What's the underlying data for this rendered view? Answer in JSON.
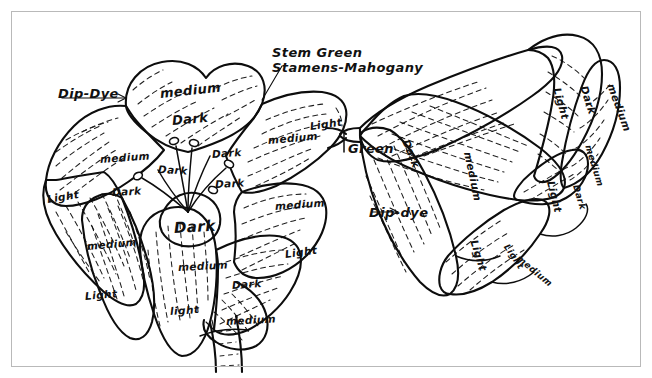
{
  "sheet": {
    "title": "Flower shading / dye plan sketch",
    "background_color": "#ffffff",
    "ink_color": "#0d0d0d",
    "frame_color": "#b9b9b9"
  },
  "callouts": [
    {
      "id": "dip-dye-left",
      "text": "Dip-Dye",
      "x": 58,
      "y": 86,
      "rot": 0
    },
    {
      "id": "stem-green",
      "text": "Stem Green",
      "x": 272,
      "y": 45,
      "rot": 0
    },
    {
      "id": "stamens",
      "text": "Stamens-Mahogany",
      "x": 272,
      "y": 60,
      "rot": 0
    },
    {
      "id": "green-stem",
      "text": "Green",
      "x": 348,
      "y": 141,
      "rot": 0
    },
    {
      "id": "dip-dye-right",
      "text": "Dip-dye",
      "x": 369,
      "y": 205,
      "rot": 0
    }
  ],
  "left_flower": {
    "name": "left-flower",
    "labels": [
      {
        "id": "l1",
        "text": "medium",
        "x": 160,
        "y": 86,
        "rot": -6,
        "size": "sz-l"
      },
      {
        "id": "l2",
        "text": "Dark",
        "x": 172,
        "y": 113,
        "rot": -5,
        "size": "sz-l"
      },
      {
        "id": "l3",
        "text": "medium",
        "x": 100,
        "y": 153,
        "rot": -4,
        "size": "sz-m"
      },
      {
        "id": "l4",
        "text": "Dark",
        "x": 158,
        "y": 163,
        "rot": 3,
        "size": "sz-m"
      },
      {
        "id": "l5",
        "text": "medium",
        "x": 268,
        "y": 134,
        "rot": -5,
        "size": "sz-m"
      },
      {
        "id": "l6",
        "text": "Light",
        "x": 310,
        "y": 120,
        "rot": -8,
        "size": "sz-m"
      },
      {
        "id": "l7",
        "text": "Dark",
        "x": 212,
        "y": 148,
        "rot": -4,
        "size": "sz-m"
      },
      {
        "id": "l8",
        "text": "Dark",
        "x": 215,
        "y": 178,
        "rot": -3,
        "size": "sz-m"
      },
      {
        "id": "l9",
        "text": "Light",
        "x": 47,
        "y": 193,
        "rot": -9,
        "size": "sz-m"
      },
      {
        "id": "l10",
        "text": "Dark",
        "x": 112,
        "y": 186,
        "rot": -3,
        "size": "sz-m"
      },
      {
        "id": "l11",
        "text": "Dark",
        "x": 174,
        "y": 219,
        "rot": -3,
        "size": "sz-xl"
      },
      {
        "id": "l12",
        "text": "medium",
        "x": 275,
        "y": 200,
        "rot": -4,
        "size": "sz-m"
      },
      {
        "id": "l13",
        "text": "medium",
        "x": 87,
        "y": 240,
        "rot": -5,
        "size": "sz-m"
      },
      {
        "id": "l14",
        "text": "medium",
        "x": 178,
        "y": 261,
        "rot": -3,
        "size": "sz-m"
      },
      {
        "id": "l15",
        "text": "Light",
        "x": 285,
        "y": 248,
        "rot": -8,
        "size": "sz-m"
      },
      {
        "id": "l16",
        "text": "Dark",
        "x": 232,
        "y": 279,
        "rot": -4,
        "size": "sz-m"
      },
      {
        "id": "l17",
        "text": "Light",
        "x": 85,
        "y": 290,
        "rot": -5,
        "size": "sz-m"
      },
      {
        "id": "l18",
        "text": "light",
        "x": 170,
        "y": 305,
        "rot": -4,
        "size": "sz-m"
      },
      {
        "id": "l19",
        "text": "medium",
        "x": 226,
        "y": 315,
        "rot": -3,
        "size": "sz-m"
      }
    ]
  },
  "right_flower": {
    "name": "right-flower",
    "labels": [
      {
        "id": "r1",
        "text": "Dark",
        "x": 406,
        "y": 134,
        "rot": 68,
        "size": "sz-m"
      },
      {
        "id": "r2",
        "text": "medium",
        "x": 468,
        "y": 146,
        "rot": 78,
        "size": "sz-m"
      },
      {
        "id": "r3",
        "text": "Light",
        "x": 557,
        "y": 82,
        "rot": 74,
        "size": "sz-m"
      },
      {
        "id": "r4",
        "text": "Dark",
        "x": 584,
        "y": 80,
        "rot": 72,
        "size": "sz-m"
      },
      {
        "id": "r5",
        "text": "medium",
        "x": 611,
        "y": 78,
        "rot": 70,
        "size": "sz-m"
      },
      {
        "id": "r6",
        "text": "medium",
        "x": 588,
        "y": 140,
        "rot": 73,
        "size": "sz-s"
      },
      {
        "id": "r7",
        "text": "Light",
        "x": 551,
        "y": 175,
        "rot": 76,
        "size": "sz-m"
      },
      {
        "id": "r8",
        "text": "Dark",
        "x": 576,
        "y": 180,
        "rot": 74,
        "size": "sz-s"
      },
      {
        "id": "r9",
        "text": "Light",
        "x": 474,
        "y": 234,
        "rot": 72,
        "size": "sz-m"
      },
      {
        "id": "r10",
        "text": "Light",
        "x": 506,
        "y": 240,
        "rot": 56,
        "size": "sz-s"
      },
      {
        "id": "r11",
        "text": "medium",
        "x": 518,
        "y": 252,
        "rot": 40,
        "size": "sz-s"
      }
    ]
  }
}
